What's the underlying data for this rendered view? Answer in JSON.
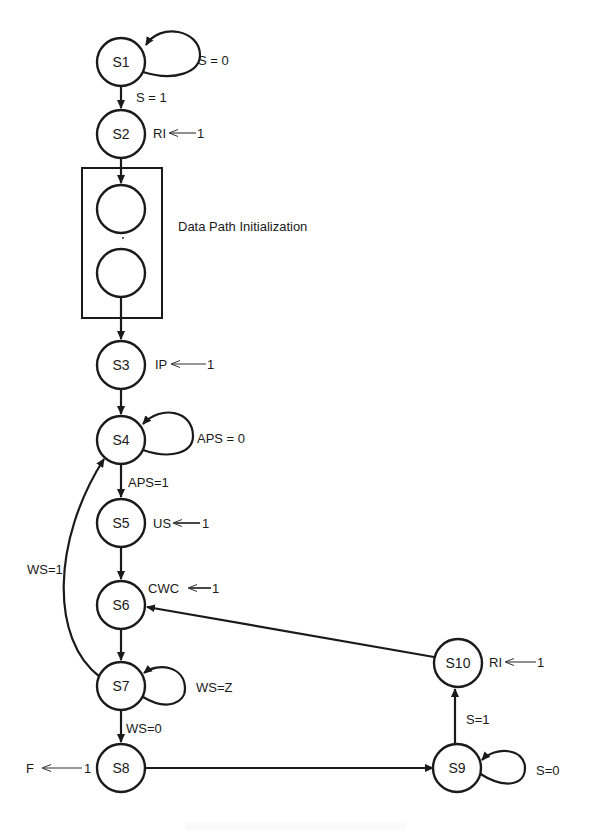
{
  "diagram": {
    "type": "state-machine",
    "nodes": [
      {
        "id": "S1",
        "label": "S1"
      },
      {
        "id": "S2",
        "label": "S2"
      },
      {
        "id": "D1",
        "label": ""
      },
      {
        "id": "D2",
        "label": ""
      },
      {
        "id": "S3",
        "label": "S3"
      },
      {
        "id": "S4",
        "label": "S4"
      },
      {
        "id": "S5",
        "label": "S5"
      },
      {
        "id": "S6",
        "label": "S6"
      },
      {
        "id": "S7",
        "label": "S7"
      },
      {
        "id": "S8",
        "label": "S8"
      },
      {
        "id": "S9",
        "label": "S9"
      },
      {
        "id": "S10",
        "label": "S10"
      }
    ],
    "group": {
      "label": "Data Path Initialization",
      "contains": [
        "D1",
        "D2"
      ]
    },
    "transitions": [
      {
        "from": "S1",
        "to": "S1",
        "label": "S = 0"
      },
      {
        "from": "S1",
        "to": "S2",
        "label": "S = 1"
      },
      {
        "from": "S2",
        "to": "D1",
        "label": ""
      },
      {
        "from": "D2",
        "to": "S3",
        "label": ""
      },
      {
        "from": "S3",
        "to": "S4",
        "label": ""
      },
      {
        "from": "S4",
        "to": "S4",
        "label": "APS = 0"
      },
      {
        "from": "S4",
        "to": "S5",
        "label": "APS=1"
      },
      {
        "from": "S5",
        "to": "S6",
        "label": ""
      },
      {
        "from": "S6",
        "to": "S7",
        "label": ""
      },
      {
        "from": "S7",
        "to": "S7",
        "label": "WS=Z"
      },
      {
        "from": "S7",
        "to": "S4",
        "label": "WS=1"
      },
      {
        "from": "S7",
        "to": "S8",
        "label": "WS=0"
      },
      {
        "from": "S8",
        "to": "S9",
        "label": ""
      },
      {
        "from": "S9",
        "to": "S9",
        "label": "S=0"
      },
      {
        "from": "S9",
        "to": "S10",
        "label": "S=1"
      },
      {
        "from": "S10",
        "to": "S6",
        "label": ""
      }
    ],
    "actions": [
      {
        "state": "S2",
        "signal": "RI",
        "value": "1"
      },
      {
        "state": "S3",
        "signal": "IP",
        "value": "1"
      },
      {
        "state": "S5",
        "signal": "US",
        "value": "1"
      },
      {
        "state": "S6",
        "signal": "CWC",
        "value": "1"
      },
      {
        "state": "S8",
        "signal": "F",
        "value": "1"
      },
      {
        "state": "S10",
        "signal": "RI",
        "value": "1"
      }
    ]
  }
}
